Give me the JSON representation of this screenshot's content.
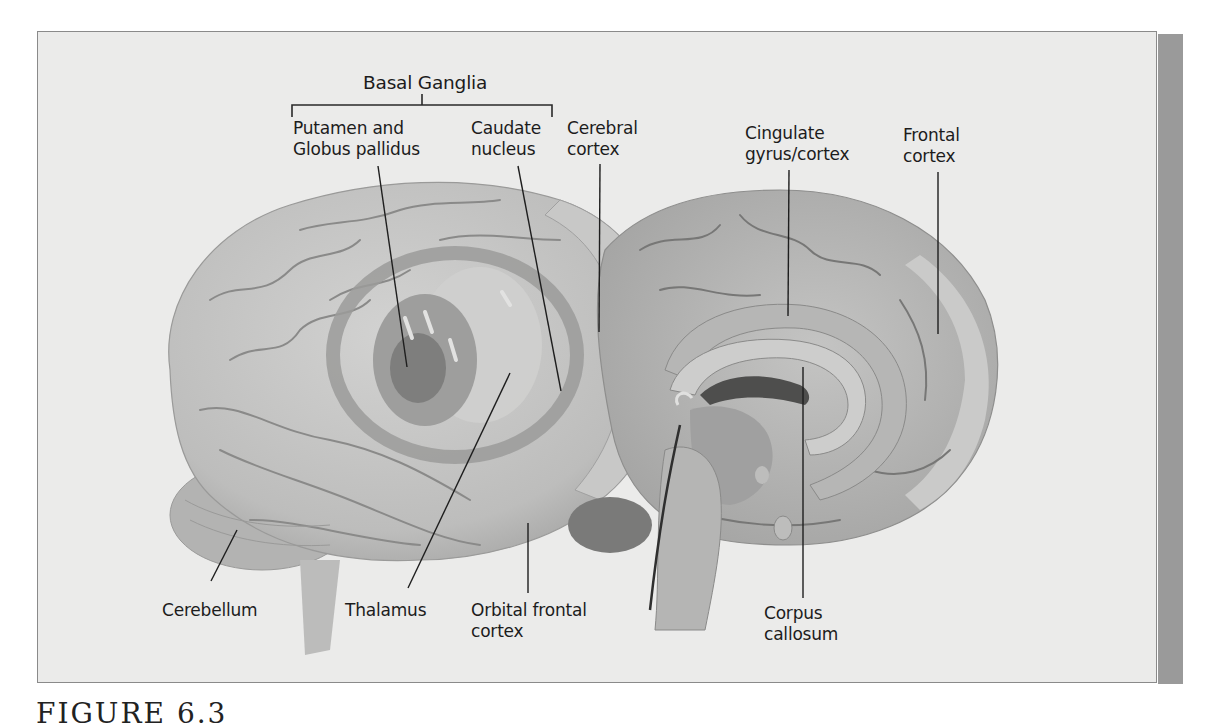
{
  "figure": {
    "caption_partial": "FIGURE 6.3",
    "colors": {
      "background": "#ebebea",
      "border": "#8a8a8a",
      "side_bar": "#9a9a9a",
      "brain_light": "#c9c9c8",
      "brain_mid": "#a9a9a8",
      "brain_dark": "#7b7b7b",
      "label_text": "#1c1c1c"
    }
  },
  "labels": {
    "basal_ganglia": "Basal Ganglia",
    "putamen": "Putamen and\nGlobus pallidus",
    "caudate": "Caudate\nnucleus",
    "cerebral_cortex": "Cerebral\ncortex",
    "cingulate": "Cingulate\ngyrus/cortex",
    "frontal_cortex": "Frontal\ncortex",
    "cerebellum": "Cerebellum",
    "thalamus": "Thalamus",
    "orbital_frontal": "Orbital frontal\ncortex",
    "corpus_callosum": "Corpus\ncallosum"
  },
  "views": {
    "left": "lateral view of brain with transparent cortex showing basal ganglia",
    "right": "medial (sagittal) view of brain"
  }
}
